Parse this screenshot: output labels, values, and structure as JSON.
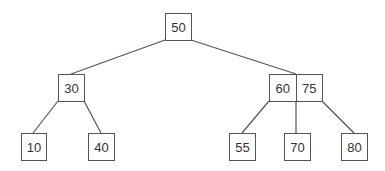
{
  "diagram": {
    "type": "b-tree",
    "line_color": "#555555",
    "nodes": [
      {
        "id": "root",
        "keys": [
          "50"
        ],
        "x": 165,
        "y": 13,
        "w": 27,
        "h": 28
      },
      {
        "id": "left",
        "keys": [
          "30"
        ],
        "x": 58,
        "y": 74,
        "w": 27,
        "h": 28
      },
      {
        "id": "right",
        "keys": [
          "60",
          "75"
        ],
        "x": 269,
        "y": 74,
        "w": 54,
        "h": 28
      },
      {
        "id": "leaf1",
        "keys": [
          "10"
        ],
        "x": 21,
        "y": 133,
        "w": 26,
        "h": 28
      },
      {
        "id": "leaf2",
        "keys": [
          "40"
        ],
        "x": 88,
        "y": 133,
        "w": 27,
        "h": 28
      },
      {
        "id": "leaf3",
        "keys": [
          "55"
        ],
        "x": 229,
        "y": 133,
        "w": 27,
        "h": 28
      },
      {
        "id": "leaf4",
        "keys": [
          "70"
        ],
        "x": 284,
        "y": 133,
        "w": 27,
        "h": 28
      },
      {
        "id": "leaf5",
        "keys": [
          "80"
        ],
        "x": 341,
        "y": 133,
        "w": 27,
        "h": 28
      }
    ],
    "edges": [
      {
        "from": "root",
        "to": "left",
        "x1": 165,
        "y1": 40,
        "x2": 71,
        "y2": 74
      },
      {
        "from": "root",
        "to": "right",
        "x1": 191,
        "y1": 40,
        "x2": 296,
        "y2": 74
      },
      {
        "from": "left",
        "to": "leaf1",
        "x1": 58,
        "y1": 101,
        "x2": 33,
        "y2": 133
      },
      {
        "from": "left",
        "to": "leaf2",
        "x1": 84,
        "y1": 101,
        "x2": 101,
        "y2": 133
      },
      {
        "from": "right",
        "to": "leaf3",
        "x1": 269,
        "y1": 101,
        "x2": 242,
        "y2": 133
      },
      {
        "from": "right",
        "to": "leaf4",
        "x1": 296,
        "y1": 101,
        "x2": 296,
        "y2": 133
      },
      {
        "from": "right",
        "to": "leaf5",
        "x1": 322,
        "y1": 101,
        "x2": 354,
        "y2": 133
      }
    ]
  }
}
